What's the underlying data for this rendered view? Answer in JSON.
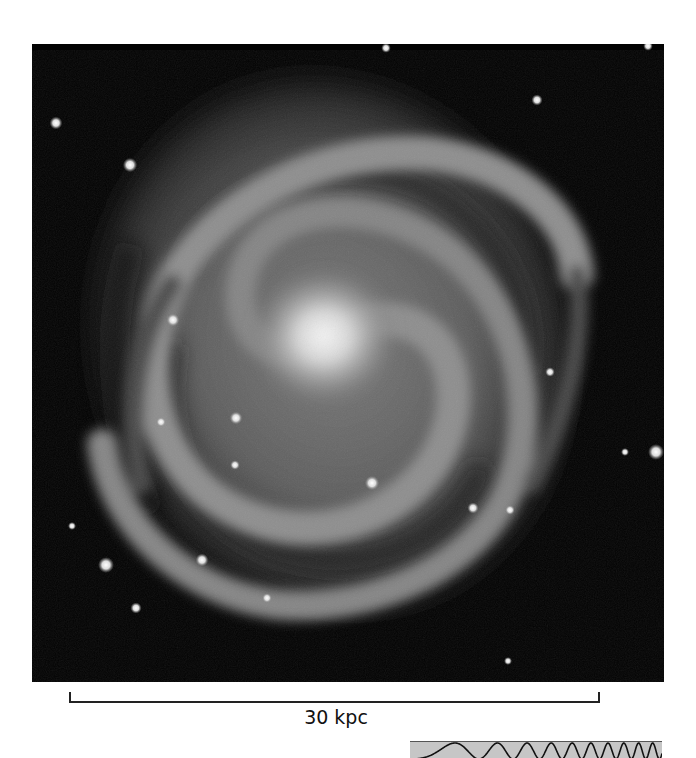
{
  "figure": {
    "background_color": "#020202",
    "galaxy_core_color": "#f4f4f4",
    "arm_color": "#8a8a8a"
  },
  "scale_bar": {
    "label": "30 kpc"
  },
  "stars": [
    {
      "x": 24,
      "y": 79,
      "r": 4
    },
    {
      "x": 98,
      "y": 121,
      "r": 4.5
    },
    {
      "x": 354,
      "y": 4,
      "r": 3
    },
    {
      "x": 505,
      "y": 56,
      "r": 3.5
    },
    {
      "x": 616,
      "y": 2,
      "r": 3
    },
    {
      "x": 624,
      "y": 408,
      "r": 5
    },
    {
      "x": 593,
      "y": 408,
      "r": 2.5
    },
    {
      "x": 74,
      "y": 521,
      "r": 5
    },
    {
      "x": 170,
      "y": 516,
      "r": 4
    },
    {
      "x": 104,
      "y": 564,
      "r": 3.5
    },
    {
      "x": 235,
      "y": 554,
      "r": 3
    },
    {
      "x": 40,
      "y": 482,
      "r": 2.5
    },
    {
      "x": 340,
      "y": 439,
      "r": 4.5
    },
    {
      "x": 141,
      "y": 276,
      "r": 4
    },
    {
      "x": 204,
      "y": 374,
      "r": 4
    },
    {
      "x": 129,
      "y": 378,
      "r": 3
    },
    {
      "x": 203,
      "y": 421,
      "r": 3
    },
    {
      "x": 441,
      "y": 464,
      "r": 3.5
    },
    {
      "x": 478,
      "y": 466,
      "r": 3
    },
    {
      "x": 476,
      "y": 617,
      "r": 2.5
    },
    {
      "x": 518,
      "y": 328,
      "r": 3
    }
  ],
  "bottom_strip": {
    "description": "chirp waveform (increasing frequency)",
    "background_color": "#c6c6c6"
  }
}
